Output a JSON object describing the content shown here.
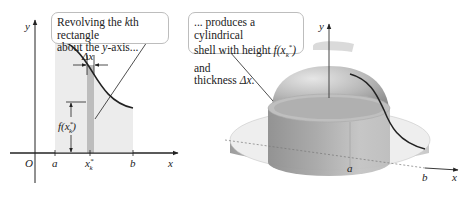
{
  "callouts": {
    "left": {
      "line1_prefix": "Revolving the ",
      "line1_var": "k",
      "line1_suffix": "th rectangle",
      "line2_prefix": "about the ",
      "line2_var": "y",
      "line2_suffix": "-axis..."
    },
    "right": {
      "line1": "... produces a cylindrical",
      "line2_prefix": "shell with height ",
      "line2_func": "f(x",
      "line2_sub": "k",
      "line2_sup": "*",
      "line2_close": ")",
      "line2_suffix": " and",
      "line3_prefix": "thickness ",
      "line3_var": "Δx",
      "line3_suffix": "."
    }
  },
  "left_plot": {
    "y_axis_label": "y",
    "x_axis_label": "x",
    "origin_label": "O",
    "tick_a": "a",
    "tick_xk": "x",
    "tick_xk_sub": "k",
    "tick_xk_sup": "*",
    "tick_b": "b",
    "delta_label": "Δx",
    "height_label": "f(x",
    "height_label_sub": "k",
    "height_label_sup": "*",
    "height_label_close": ")"
  },
  "right_plot": {
    "y_axis_label": "y",
    "x_axis_label": "x",
    "tick_a": "a",
    "tick_b": "b"
  },
  "colors": {
    "region_fill": "#ebebeb",
    "rectangle_fill": "#bdbdbd",
    "curve": "#222222",
    "callout_border": "#bdbdbd",
    "solid_light": "#e2e2e2",
    "solid_dark": "#9a9a9a"
  }
}
